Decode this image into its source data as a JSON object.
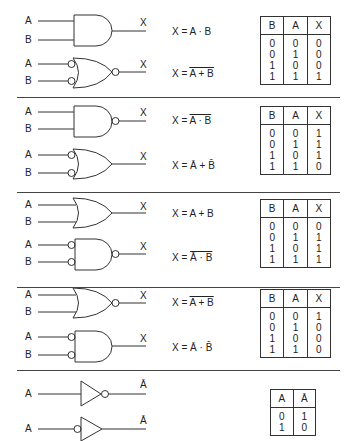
{
  "sections": [
    {
      "gates": [
        {
          "type": "AND",
          "inputs": [
            "A",
            "B"
          ],
          "output": "X",
          "equation": {
            "prefix": "X = ",
            "expr": "A · B",
            "overline": ""
          }
        },
        {
          "type": "NOR-inverted-inputs",
          "inputs": [
            "A",
            "B"
          ],
          "output": "X",
          "equation": {
            "prefix": "X = ",
            "expr": "",
            "overline": "A + B",
            "bars": "double"
          }
        }
      ],
      "table": {
        "headers": [
          "B",
          "A",
          "X"
        ],
        "rows": [
          [
            "0",
            "0",
            "0"
          ],
          [
            "0",
            "1",
            "0"
          ],
          [
            "1",
            "0",
            "0"
          ],
          [
            "1",
            "1",
            "1"
          ]
        ]
      }
    },
    {
      "gates": [
        {
          "type": "NAND",
          "inputs": [
            "A",
            "B"
          ],
          "output": "X",
          "equation": {
            "prefix": "X = ",
            "overline": "A · B"
          }
        },
        {
          "type": "OR-inverted-inputs",
          "inputs": [
            "A",
            "B"
          ],
          "output": "X",
          "equation": {
            "prefix": "X = ",
            "terms": [
              "Ā",
              "+",
              "B̄"
            ]
          }
        }
      ],
      "table": {
        "headers": [
          "B",
          "A",
          "X"
        ],
        "rows": [
          [
            "0",
            "0",
            "1"
          ],
          [
            "0",
            "1",
            "1"
          ],
          [
            "1",
            "0",
            "1"
          ],
          [
            "1",
            "1",
            "0"
          ]
        ]
      }
    },
    {
      "gates": [
        {
          "type": "OR",
          "inputs": [
            "A",
            "B"
          ],
          "output": "X",
          "equation": {
            "prefix": "X = ",
            "expr": "A + B"
          }
        },
        {
          "type": "NAND-inverted-inputs",
          "inputs": [
            "A",
            "B"
          ],
          "output": "X",
          "equation": {
            "prefix": "X = ",
            "overline": "Ā · B̄"
          }
        }
      ],
      "table": {
        "headers": [
          "B",
          "A",
          "X"
        ],
        "rows": [
          [
            "0",
            "0",
            "0"
          ],
          [
            "0",
            "1",
            "1"
          ],
          [
            "1",
            "0",
            "1"
          ],
          [
            "1",
            "1",
            "1"
          ]
        ]
      }
    },
    {
      "gates": [
        {
          "type": "NOR",
          "inputs": [
            "A",
            "B"
          ],
          "output": "X",
          "equation": {
            "prefix": "X = ",
            "overline": "A + B"
          }
        },
        {
          "type": "AND-inverted-inputs",
          "inputs": [
            "A",
            "B"
          ],
          "output": "X",
          "equation": {
            "prefix": "X = ",
            "terms": [
              "Ā",
              "·",
              "B̄"
            ]
          }
        }
      ],
      "table": {
        "headers": [
          "B",
          "A",
          "X"
        ],
        "rows": [
          [
            "0",
            "0",
            "1"
          ],
          [
            "0",
            "1",
            "0"
          ],
          [
            "1",
            "0",
            "0"
          ],
          [
            "1",
            "1",
            "0"
          ]
        ]
      }
    },
    {
      "gates": [
        {
          "type": "NOT-output-bubble",
          "inputs": [
            "A"
          ],
          "output": "Ā"
        },
        {
          "type": "NOT-input-bubble",
          "inputs": [
            "A"
          ],
          "output": "Ā"
        }
      ],
      "table": {
        "headers": [
          "A",
          "Ā"
        ],
        "rows": [
          [
            "0",
            "1"
          ],
          [
            "1",
            "0"
          ]
        ]
      }
    }
  ],
  "labels": {
    "A": "A",
    "B": "B",
    "X": "X",
    "Abar": "Ā",
    "eq_prefix": "X = ",
    "dot": "·",
    "plus": "+"
  }
}
